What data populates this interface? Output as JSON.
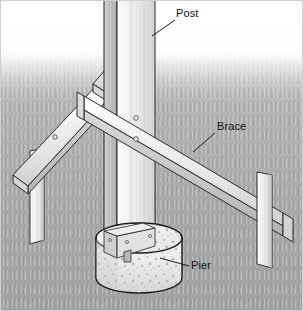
{
  "figure": {
    "type": "technical-illustration",
    "width": 303,
    "height": 311,
    "background_top_color": "#ffffff",
    "ground_color": "#a9a9a9",
    "outline_color": "#1a1a1a",
    "lumber_light": "#f2f2f2",
    "lumber_mid": "#d8d8d8",
    "lumber_shade": "#b8b8b8",
    "concrete_color": "#efefef"
  },
  "labels": [
    {
      "id": "post",
      "text": "Post",
      "x": 176,
      "y": 8,
      "leader_from_x": 175,
      "leader_from_y": 20,
      "leader_to_x": 152,
      "leader_to_y": 36
    },
    {
      "id": "brace",
      "text": "Brace",
      "x": 217,
      "y": 121,
      "leader_from_x": 215,
      "leader_from_y": 133,
      "leader_to_x": 193,
      "leader_to_y": 152
    },
    {
      "id": "pier",
      "text": "Pier",
      "x": 191,
      "y": 260,
      "leader_from_x": 189,
      "leader_from_y": 266,
      "leader_to_x": 160,
      "leader_to_y": 258
    }
  ],
  "parts": {
    "post": {
      "name": "Post",
      "description": "Vertical 4x4 timber post running from top of frame down into the concrete pier"
    },
    "brace_left": {
      "name": "Brace",
      "description": "Diagonal brace from post down to left ground stake"
    },
    "brace_right": {
      "name": "Brace",
      "description": "Diagonal brace from post down to right ground stake"
    },
    "stake_left": {
      "name": "Stake",
      "description": "Vertical wood stake driven into the ground at the left"
    },
    "stake_right": {
      "name": "Stake",
      "description": "Vertical wood stake driven into the ground at the right"
    },
    "pier": {
      "name": "Pier",
      "description": "Round concrete pier footing with aggregate speckle"
    },
    "bracket": {
      "name": "Post base bracket",
      "description": "Metal post base plate on top of the concrete pier"
    }
  },
  "ground": {
    "horizon_y": 70,
    "texture": "grass-blades"
  }
}
